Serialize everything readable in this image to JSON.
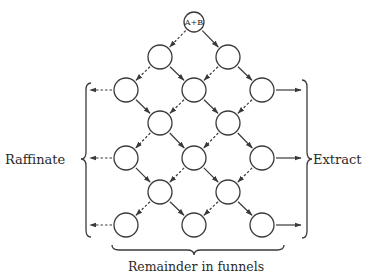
{
  "diagram": {
    "type": "countercurrent-extraction-funnel-network",
    "start_node": {
      "id": "n0",
      "label": "A+B"
    },
    "labels": {
      "left": "Raffinate",
      "right": "Extract",
      "bottom": "Remainder in funnels"
    },
    "nodes": [
      {
        "id": "n0",
        "row": 0,
        "col": 2,
        "label": "A+B"
      },
      {
        "id": "r1a",
        "row": 1,
        "col": 1,
        "label": ""
      },
      {
        "id": "r1b",
        "row": 1,
        "col": 3,
        "label": ""
      },
      {
        "id": "r2a",
        "row": 2,
        "col": 0,
        "label": ""
      },
      {
        "id": "r2b",
        "row": 2,
        "col": 2,
        "label": ""
      },
      {
        "id": "r2c",
        "row": 2,
        "col": 4,
        "label": ""
      },
      {
        "id": "r3a",
        "row": 3,
        "col": 1,
        "label": ""
      },
      {
        "id": "r3b",
        "row": 3,
        "col": 3,
        "label": ""
      },
      {
        "id": "r4a",
        "row": 4,
        "col": 0,
        "label": ""
      },
      {
        "id": "r4b",
        "row": 4,
        "col": 2,
        "label": ""
      },
      {
        "id": "r4c",
        "row": 4,
        "col": 4,
        "label": ""
      },
      {
        "id": "r5a",
        "row": 5,
        "col": 1,
        "label": ""
      },
      {
        "id": "r5b",
        "row": 5,
        "col": 3,
        "label": ""
      },
      {
        "id": "r6a",
        "row": 6,
        "col": 0,
        "label": ""
      },
      {
        "id": "r6b",
        "row": 6,
        "col": 2,
        "label": ""
      },
      {
        "id": "r6c",
        "row": 6,
        "col": 4,
        "label": ""
      }
    ],
    "edges": [
      {
        "from": "n0",
        "to": "r1a",
        "style": "dashed"
      },
      {
        "from": "n0",
        "to": "r1b",
        "style": "solid"
      },
      {
        "from": "r1a",
        "to": "r2a",
        "style": "dashed"
      },
      {
        "from": "r1a",
        "to": "r2b",
        "style": "solid"
      },
      {
        "from": "r1b",
        "to": "r2b",
        "style": "dashed"
      },
      {
        "from": "r1b",
        "to": "r2c",
        "style": "solid"
      },
      {
        "from": "r2a",
        "to": "r3a",
        "style": "solid"
      },
      {
        "from": "r2b",
        "to": "r3a",
        "style": "dashed"
      },
      {
        "from": "r2b",
        "to": "r3b",
        "style": "solid"
      },
      {
        "from": "r2c",
        "to": "r3b",
        "style": "dashed"
      },
      {
        "from": "r3a",
        "to": "r4a",
        "style": "dashed"
      },
      {
        "from": "r3a",
        "to": "r4b",
        "style": "solid"
      },
      {
        "from": "r3b",
        "to": "r4b",
        "style": "dashed"
      },
      {
        "from": "r3b",
        "to": "r4c",
        "style": "solid"
      },
      {
        "from": "r4a",
        "to": "r5a",
        "style": "solid"
      },
      {
        "from": "r4b",
        "to": "r5a",
        "style": "dashed"
      },
      {
        "from": "r4b",
        "to": "r5b",
        "style": "solid"
      },
      {
        "from": "r4c",
        "to": "r5b",
        "style": "dashed"
      },
      {
        "from": "r5a",
        "to": "r6a",
        "style": "dashed"
      },
      {
        "from": "r5a",
        "to": "r6b",
        "style": "solid"
      },
      {
        "from": "r5b",
        "to": "r6b",
        "style": "dashed"
      },
      {
        "from": "r5b",
        "to": "r6c",
        "style": "solid"
      }
    ],
    "outputs": [
      {
        "from": "r2a",
        "direction": "left",
        "style": "dashed"
      },
      {
        "from": "r4a",
        "direction": "left",
        "style": "dashed"
      },
      {
        "from": "r6a",
        "direction": "left",
        "style": "dashed"
      },
      {
        "from": "r2c",
        "direction": "right",
        "style": "solid"
      },
      {
        "from": "r4c",
        "direction": "right",
        "style": "solid"
      },
      {
        "from": "r6c",
        "direction": "right",
        "style": "solid"
      }
    ],
    "colors": {
      "ink": "#3a3a3a",
      "background": "#ffffff"
    }
  }
}
